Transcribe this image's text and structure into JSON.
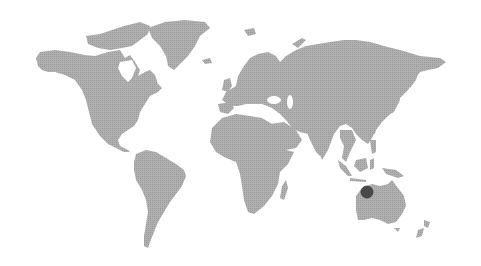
{
  "map": {
    "type": "world-map",
    "projection": "equirectangular-like",
    "style": "dotted halftone landmass",
    "land_color": "#a4a4a4",
    "background_color": "#ffffff",
    "continents": [
      "North America",
      "Greenland",
      "South America",
      "Europe",
      "Africa",
      "Asia",
      "Australia",
      "New Zealand"
    ]
  },
  "markers": [
    {
      "label": "Western Australia",
      "color": "#4a4a4a",
      "x": 367,
      "y": 192,
      "radius": 6
    }
  ]
}
